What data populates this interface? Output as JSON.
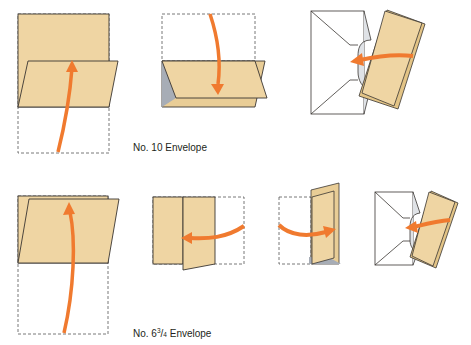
{
  "diagram": {
    "colors": {
      "paper": "#efd5a3",
      "paper_dark": "#e3c486",
      "outline": "#3a3632",
      "arrow": "#f07a2f",
      "envelope": "#ffffff",
      "envelope_inner": "#dfe2e6",
      "fold_shadow": "#a7adb6",
      "dashed": "#555555"
    },
    "rows": [
      {
        "label": "No. 10 Envelope",
        "steps": [
          {
            "id": "step-1",
            "description": "Fold bottom third of the sheet up"
          },
          {
            "id": "step-2",
            "description": "Fold top third down over it"
          },
          {
            "id": "step-3",
            "description": "Insert folded letter into envelope"
          }
        ]
      },
      {
        "label_prefix": "No. 6",
        "label_fraction_num": "3",
        "label_fraction_den": "4",
        "label_suffix": " Envelope",
        "steps": [
          {
            "id": "step-1",
            "description": "Fold bottom half up"
          },
          {
            "id": "step-2",
            "description": "Fold right third to the left"
          },
          {
            "id": "step-3",
            "description": "Fold left third to the right"
          },
          {
            "id": "step-4",
            "description": "Insert folded letter into envelope"
          }
        ]
      }
    ]
  }
}
